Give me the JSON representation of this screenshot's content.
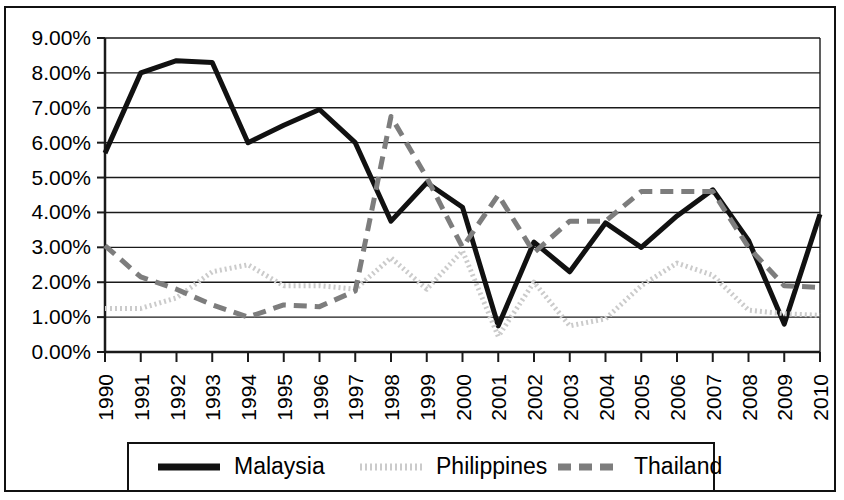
{
  "chart_data": {
    "type": "line",
    "title": "",
    "subtitle": "",
    "xlabel": "",
    "ylabel": "",
    "grid": true,
    "grid_axis": "y",
    "legend_position": "bottom",
    "value_format": "percent",
    "x": [
      1990,
      1991,
      1992,
      1993,
      1994,
      1995,
      1996,
      1997,
      1998,
      1999,
      2000,
      2001,
      2002,
      2003,
      2004,
      2005,
      2006,
      2007,
      2008,
      2009,
      2010
    ],
    "categories": [
      "1990",
      "1991",
      "1992",
      "1993",
      "1994",
      "1995",
      "1996",
      "1997",
      "1998",
      "1999",
      "2000",
      "2001",
      "2002",
      "2003",
      "2004",
      "2005",
      "2006",
      "2007",
      "2008",
      "2009",
      "2010"
    ],
    "xtick_labels": [
      "1990",
      "1991",
      "1992",
      "1993",
      "1994",
      "1995",
      "1996",
      "1997",
      "1998",
      "1999",
      "2000",
      "2001",
      "2002",
      "2003",
      "2004",
      "2005",
      "2006",
      "2007",
      "2008",
      "2009",
      "2010"
    ],
    "ytick_values": [
      0,
      1,
      2,
      3,
      4,
      5,
      6,
      7,
      8,
      9
    ],
    "ytick_labels": [
      "0.00%",
      "1.00%",
      "2.00%",
      "3.00%",
      "4.00%",
      "5.00%",
      "6.00%",
      "7.00%",
      "8.00%",
      "9.00%"
    ],
    "ylim": [
      0,
      9
    ],
    "xlim": [
      1990,
      2010
    ],
    "series": [
      {
        "name": "Malaysia",
        "color": "#111111",
        "style": "solid",
        "width": 5,
        "dasharray": "",
        "values": [
          5.7,
          8.0,
          8.35,
          8.3,
          6.0,
          6.5,
          6.95,
          6.0,
          3.75,
          4.85,
          4.15,
          0.75,
          3.15,
          2.3,
          3.7,
          3.0,
          3.9,
          4.65,
          3.2,
          0.8,
          3.95
        ]
      },
      {
        "name": "Philippines",
        "color": "#cbcbcb",
        "style": "dotted",
        "width": 5,
        "dasharray": "2 3",
        "values": [
          1.25,
          1.25,
          1.55,
          2.3,
          2.5,
          1.9,
          1.9,
          1.8,
          2.7,
          1.8,
          2.9,
          0.45,
          2.0,
          0.75,
          0.95,
          1.9,
          2.55,
          2.2,
          1.2,
          1.1,
          1.05
        ]
      },
      {
        "name": "Thailand",
        "color": "#7d7d7d",
        "style": "dashed",
        "width": 5,
        "dasharray": "13 8",
        "values": [
          3.05,
          2.15,
          1.8,
          1.35,
          1.0,
          1.35,
          1.3,
          1.75,
          6.75,
          5.0,
          3.0,
          4.5,
          2.85,
          3.75,
          3.75,
          4.6,
          4.6,
          4.6,
          3.0,
          1.9,
          1.85
        ]
      }
    ]
  },
  "legend": {
    "entries": [
      {
        "label": "Malaysia"
      },
      {
        "label": "Philippines"
      },
      {
        "label": "Thailand"
      }
    ]
  }
}
